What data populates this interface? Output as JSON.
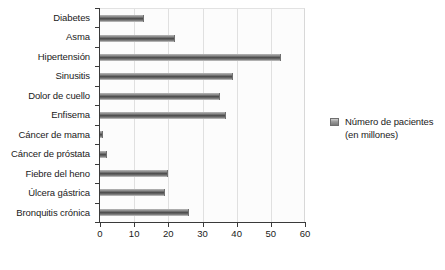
{
  "chart_data": {
    "type": "bar",
    "orientation": "horizontal",
    "title": "",
    "xlabel": "",
    "ylabel": "",
    "xlim": [
      0,
      60
    ],
    "xticks": [
      0,
      10,
      20,
      30,
      40,
      50,
      60
    ],
    "grid": true,
    "legend_position": "right",
    "legend": [
      "Número de pacientes\n(en millones)"
    ],
    "categories": [
      "Diabetes",
      "Asma",
      "Hipertensión",
      "Sinusitis",
      "Dolor de cuello",
      "Enfisema",
      "Cáncer de mama",
      "Cáncer de próstata",
      "Fiebre del heno",
      "Úlcera gástrica",
      "Bronquitis crónica"
    ],
    "values": [
      13,
      22,
      53,
      39,
      35,
      37,
      1,
      2,
      20,
      19,
      26
    ],
    "series": [
      {
        "name": "Número de pacientes (en millones)",
        "values": [
          13,
          22,
          53,
          39,
          35,
          37,
          1,
          2,
          20,
          19,
          26
        ]
      }
    ],
    "colors": {
      "bar": "#4a4a4a",
      "grid": "#e0e0e0",
      "axis": "#3a3a3a",
      "plot_background": "#fcfcfc",
      "text": "#1a1a1a"
    }
  },
  "legend": {
    "label": "Número de pacientes\n(en millones)"
  }
}
